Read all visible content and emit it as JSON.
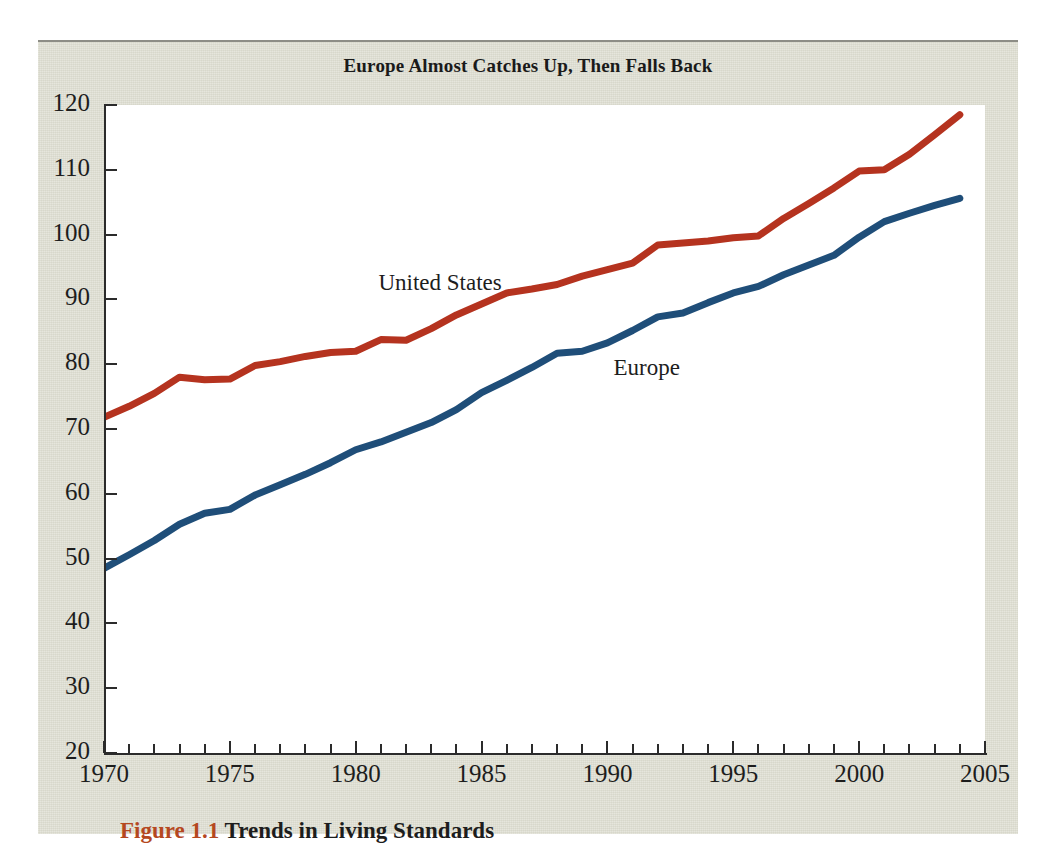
{
  "figure": {
    "title": "Europe Almost Catches Up, Then Falls Back",
    "caption_figure_number": "Figure 1.1",
    "caption_text": "Trends in Living Standards",
    "panel_color": "#dcdccf",
    "plot_background": "#ffffff",
    "axis_color": "#2b2b2b"
  },
  "chart_data": {
    "type": "line",
    "title": "Europe Almost Catches Up, Then Falls Back",
    "subtitle": "",
    "xlabel": "",
    "ylabel": "",
    "xlim": [
      1970,
      2005
    ],
    "ylim": [
      20,
      120
    ],
    "grid": false,
    "legend_position": "inline-annotation",
    "x_ticks_major": [
      1970,
      1975,
      1980,
      1985,
      1990,
      1995,
      2000,
      2005
    ],
    "x_tick_labels": [
      "1970",
      "1975",
      "1980",
      "1985",
      "1990",
      "1995",
      "2000",
      "2005"
    ],
    "x_ticks_minor_step": 1,
    "y_ticks": [
      20,
      30,
      40,
      50,
      60,
      70,
      80,
      90,
      100,
      110,
      120
    ],
    "y_tick_labels": [
      "20",
      "30",
      "40",
      "50",
      "60",
      "70",
      "80",
      "90",
      "100",
      "110",
      "120"
    ],
    "x": [
      1970,
      1971,
      1972,
      1973,
      1974,
      1975,
      1976,
      1977,
      1978,
      1979,
      1980,
      1981,
      1982,
      1983,
      1984,
      1985,
      1986,
      1987,
      1988,
      1989,
      1990,
      1991,
      1992,
      1993,
      1994,
      1995,
      1996,
      1997,
      1998,
      1999,
      2000,
      2001,
      2002,
      2003,
      2004
    ],
    "series": [
      {
        "name": "United States",
        "color": "#b5331f",
        "label_x": 1984,
        "label_y": 92,
        "values": [
          71.8,
          73.5,
          75.5,
          78.0,
          77.6,
          77.7,
          79.8,
          80.4,
          81.2,
          81.8,
          82.0,
          83.8,
          83.7,
          85.5,
          87.6,
          89.3,
          91.0,
          91.6,
          92.3,
          93.6,
          94.6,
          95.6,
          98.4,
          98.7,
          99.0,
          99.5,
          99.8,
          102.5,
          104.8,
          107.2,
          109.8,
          110.0,
          112.4,
          115.4,
          118.5
        ]
      },
      {
        "name": "Europe",
        "color": "#1f4e79",
        "label_x": 1990,
        "label_y": 79,
        "values": [
          48.5,
          50.6,
          52.8,
          55.3,
          57.0,
          57.6,
          59.8,
          61.4,
          63.0,
          64.8,
          66.8,
          68.0,
          69.5,
          71.0,
          73.0,
          75.6,
          77.5,
          79.5,
          81.7,
          82.0,
          83.3,
          85.2,
          87.3,
          87.9,
          89.5,
          91.0,
          92.0,
          93.8,
          95.3,
          96.8,
          99.6,
          102.0,
          103.3,
          104.5,
          105.6
        ]
      }
    ]
  }
}
